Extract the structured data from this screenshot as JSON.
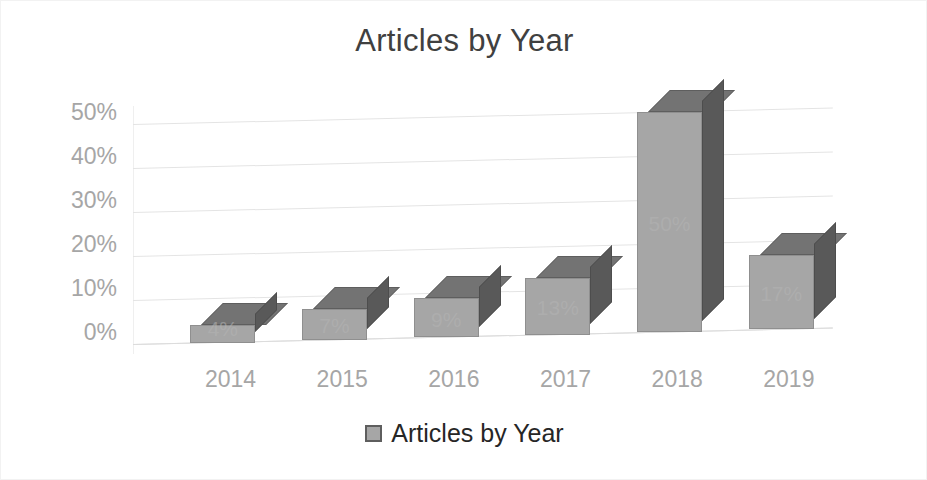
{
  "chart_data": {
    "type": "bar",
    "title": "Articles by Year",
    "xlabel": "",
    "ylabel": "",
    "categories": [
      "2014",
      "2015",
      "2016",
      "2017",
      "2018",
      "2019"
    ],
    "values": [
      4,
      7,
      9,
      13,
      50,
      17
    ],
    "value_labels": [
      "4%",
      "7%",
      "9%",
      "13%",
      "50%",
      "17%"
    ],
    "series": [
      {
        "name": "Articles by Year",
        "values": [
          4,
          7,
          9,
          13,
          50,
          17
        ]
      }
    ],
    "ylim": [
      0,
      50
    ],
    "ytick_labels": [
      "50%",
      "40%",
      "30%",
      "20%",
      "10%",
      "0%"
    ],
    "ytick_values": [
      50,
      40,
      30,
      20,
      10,
      0
    ],
    "grid": true,
    "legend_position": "bottom",
    "style": "3d-column",
    "colors": {
      "bar_front": "#a6a6a6",
      "bar_top": "#737373",
      "bar_side": "#595959",
      "gridline": "#e4e4e4",
      "tick_text": "#a6a6a6",
      "title_text": "#404040",
      "legend_text": "#262626",
      "background": "#ffffff"
    }
  },
  "legend": {
    "entries": [
      {
        "label": "Articles by Year",
        "swatch": "legend-swatch-gray"
      }
    ]
  }
}
